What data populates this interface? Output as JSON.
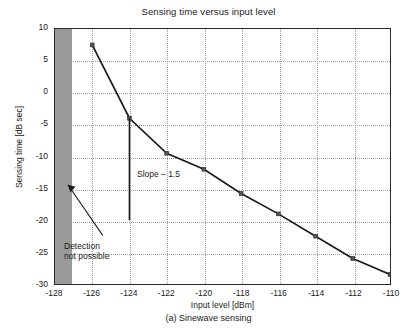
{
  "figure": {
    "caption": "(a)  Sinewave sensing"
  },
  "chart_data": {
    "type": "line",
    "title": "Sensing time versus input level",
    "xlabel": "Input level [dBm]",
    "ylabel": "Sensing time [dB sec]",
    "xlim": [
      -128,
      -110
    ],
    "ylim": [
      -30,
      10
    ],
    "xticks": [
      -128,
      -126,
      -124,
      -122,
      -120,
      -118,
      -116,
      -114,
      -112,
      -110
    ],
    "xticklabels": [
      "-128",
      "-126",
      "-124",
      "-122",
      "-120",
      "-118",
      "-116",
      "-114",
      "-112",
      "-110"
    ],
    "yticks": [
      10,
      5,
      0,
      -5,
      -10,
      -15,
      -20,
      -25,
      -30
    ],
    "yticklabels": [
      "10",
      "5",
      "0",
      "-5",
      "-10",
      "-15",
      "-20",
      "-25",
      "-30"
    ],
    "grid": true,
    "legend": null,
    "series": [
      {
        "name": "Sensing time",
        "marker": "square",
        "color": "#1a1a1a",
        "x": [
          -126,
          -124,
          -122,
          -120,
          -118,
          -116,
          -114,
          -112,
          -110
        ],
        "values": [
          7.5,
          -4.0,
          -9.5,
          -12.0,
          -15.8,
          -19.0,
          -22.5,
          -26.0,
          -28.5
        ]
      }
    ],
    "shaded_regions": [
      {
        "name": "detection-not-possible-band",
        "x_start": -128,
        "x_end": -127.1,
        "color": "#9a9a9a"
      }
    ],
    "annotations": [
      {
        "name": "slope-annotation",
        "text": "Slope – 1.5",
        "x": -123.2,
        "y": -21.8
      },
      {
        "name": "detection-annotation",
        "text": "Detection\nnot possible",
        "x": -127.6,
        "y": -19.5,
        "arrow_to_x": -127.6,
        "arrow_to_y": -19.5
      }
    ],
    "reference_lines": [
      {
        "name": "slope-vertical-line",
        "x": -124,
        "y_start": -4.0,
        "y_end": -20.0,
        "color": "#1a1a1a"
      }
    ]
  }
}
